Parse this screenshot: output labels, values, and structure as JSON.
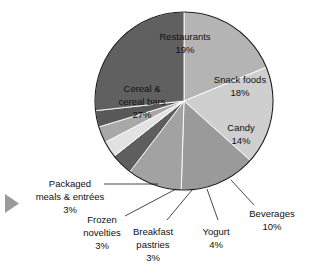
{
  "chart_data": {
    "type": "pie",
    "title": "",
    "subtitle": "",
    "xlabel": "",
    "ylabel": "",
    "legend_position": "none",
    "grid": false,
    "units": "percent",
    "categories": [
      "Restaurants",
      "Snack foods",
      "Candy",
      "Beverages",
      "Yogurt",
      "Breakfast pastries",
      "Frozen novelties",
      "Packaged meals & entrées",
      "Cereal & cereal bars"
    ],
    "values": [
      19,
      18,
      14,
      10,
      4,
      3,
      3,
      3,
      27
    ],
    "colors": [
      "#b4b4b4",
      "#cfcfcf",
      "#9a9a9a",
      "#a2a2a2",
      "#5e5e5e",
      "#e2e2e2",
      "#a8a8a8",
      "#585858",
      "#606060"
    ],
    "start_angle_deg": 0,
    "direction": "clockwise",
    "slices": [
      {
        "name": "Restaurants",
        "label": "Restaurants",
        "value": 19,
        "value_label": "19%",
        "color": "#b4b4b4",
        "label_placement": "inside"
      },
      {
        "name": "Snack foods",
        "label": "Snack foods",
        "value": 18,
        "value_label": "18%",
        "color": "#cfcfcf",
        "label_placement": "inside"
      },
      {
        "name": "Candy",
        "label": "Candy",
        "value": 14,
        "value_label": "14%",
        "color": "#9a9a9a",
        "label_placement": "inside"
      },
      {
        "name": "Beverages",
        "label": "Beverages",
        "value": 10,
        "value_label": "10%",
        "color": "#a2a2a2",
        "label_placement": "outside"
      },
      {
        "name": "Yogurt",
        "label": "Yogurt",
        "value": 4,
        "value_label": "4%",
        "color": "#5e5e5e",
        "label_placement": "outside"
      },
      {
        "name": "Breakfast pastries",
        "label": "Breakfast pastries",
        "value": 3,
        "value_label": "3%",
        "color": "#e2e2e2",
        "label_placement": "outside"
      },
      {
        "name": "Frozen novelties",
        "label": "Frozen novelties",
        "value": 3,
        "value_label": "3%",
        "color": "#a8a8a8",
        "label_placement": "outside"
      },
      {
        "name": "Packaged meals & entrées",
        "label": "Packaged meals & entrées",
        "value": 3,
        "value_label": "3%",
        "color": "#585858",
        "label_placement": "outside"
      },
      {
        "name": "Cereal & cereal bars",
        "label": "Cereal & cereal bars",
        "value": 27,
        "value_label": "27%",
        "color": "#606060",
        "label_placement": "inside"
      }
    ]
  },
  "labels": {
    "restaurants_line1": "Restaurants",
    "restaurants_line2": "19%",
    "snack_foods_line1": "Snack foods",
    "snack_foods_line2": "18%",
    "candy_line1": "Candy",
    "candy_line2": "14%",
    "cereal_line1": "Cereal &",
    "cereal_line2": "cereal bars",
    "cereal_line3": "27%",
    "packaged_line1": "Packaged",
    "packaged_line2": "meals & entrées",
    "packaged_line3": "3%",
    "frozen_line1": "Frozen",
    "frozen_line2": "novelties",
    "frozen_line3": "3%",
    "breakfast_line1": "Breakfast",
    "breakfast_line2": "pastries",
    "breakfast_line3": "3%",
    "yogurt_line1": "Yogurt",
    "yogurt_line2": "4%",
    "beverages_line1": "Beverages",
    "beverages_line2": "10%"
  },
  "marker": {
    "name": "play-triangle-marker",
    "color": "#9a9a9a"
  }
}
